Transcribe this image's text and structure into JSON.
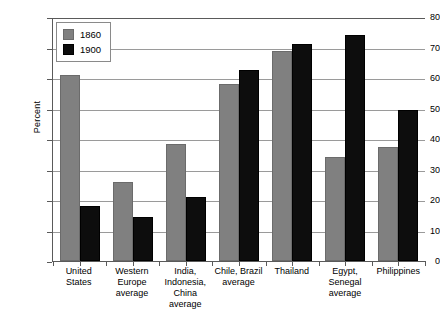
{
  "chart_data": {
    "type": "bar",
    "title": "",
    "xlabel": "",
    "ylabel": "Percent",
    "ylim": [
      0,
      80
    ],
    "yticks": [
      0,
      10,
      20,
      30,
      40,
      50,
      60,
      70,
      80
    ],
    "grid": true,
    "legend_position": "top-left",
    "categories": [
      "United States",
      "Western Europe average",
      "India, Indonesia, China average",
      "Chile, Brazil average",
      "Thailand",
      "Egypt, Senegal average",
      "Philippines"
    ],
    "category_lines": [
      [
        "United States"
      ],
      [
        "Western",
        "Europe",
        "average"
      ],
      [
        "India,",
        "Indonesia,",
        "China average"
      ],
      [
        "Chile, Brazil",
        "average"
      ],
      [
        "Thailand"
      ],
      [
        "Egypt,",
        "Senegal",
        "average"
      ],
      [
        "Philippines"
      ]
    ],
    "series": [
      {
        "name": "1860",
        "color": "#808080",
        "values": [
          61,
          26,
          38.5,
          58,
          69,
          34,
          37.5
        ]
      },
      {
        "name": "1900",
        "color": "#0d0d0d",
        "values": [
          18,
          14.5,
          21,
          62.5,
          71,
          74,
          49.5
        ]
      }
    ]
  },
  "colors": {
    "series_1860": "#808080",
    "series_1900": "#0d0d0d",
    "gridline": "#9a9a9a",
    "axis": "#5a5a5a",
    "background": "#ffffff"
  },
  "caption": {
    "text": ""
  }
}
